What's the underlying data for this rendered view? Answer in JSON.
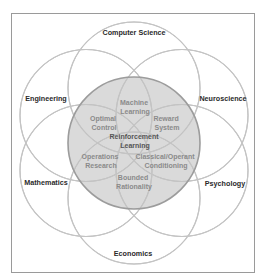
{
  "diagram": {
    "type": "venn-flower",
    "colors": {
      "frame": "#9a9a9a",
      "outer_circles": "#c4c4c4",
      "core_fill": "#dadada",
      "core_outline": "#9c9c9c",
      "discipline_text": "#2a2a2a",
      "subfield_text": "#8a8a8a"
    },
    "core": {
      "line1": "Reinforcement",
      "line2": "Learning"
    },
    "disciplines": {
      "top": "Computer Science",
      "upper_left": "Engineering",
      "upper_right": "Neuroscience",
      "lower_left": "Mathematics",
      "lower_right": "Psychology",
      "bottom": "Economics"
    },
    "subfields": {
      "machine_learning": {
        "line1": "Machine",
        "line2": "Learning"
      },
      "optimal_control": {
        "line1": "Optimal",
        "line2": "Control"
      },
      "reward_system": {
        "line1": "Reward",
        "line2": "System"
      },
      "operations_research": {
        "line1": "Operations",
        "line2": "Research"
      },
      "classical_operant": {
        "line1": "Classical/Operant",
        "line2": "Conditioning"
      },
      "bounded_rationality": {
        "line1": "Bounded",
        "line2": "Rationality"
      }
    }
  }
}
